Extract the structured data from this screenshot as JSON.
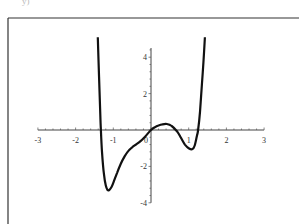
{
  "corner_label": "y)",
  "chart_data": {
    "type": "line",
    "title": "",
    "xlabel": "",
    "ylabel": "",
    "xlim": [
      -3,
      3
    ],
    "ylim": [
      -4,
      5
    ],
    "x_ticks": [
      "-3",
      "-2",
      "-1",
      "0",
      "1",
      "2",
      "3"
    ],
    "y_ticks": [
      "4",
      "2",
      "-2",
      "-4"
    ],
    "grid": false,
    "legend": null,
    "series": [
      {
        "name": "f(x)",
        "color": "#111111",
        "x": [
          -1.41,
          -1.38,
          -1.35,
          -1.33,
          -1.3,
          -1.25,
          -1.2,
          -1.15,
          -1.11,
          -1.05,
          -1.0,
          -0.9,
          -0.8,
          -0.7,
          -0.6,
          -0.5,
          -0.4,
          -0.27,
          -0.15,
          0.0,
          0.1,
          0.2,
          0.3,
          0.42,
          0.55,
          0.7,
          0.8,
          0.9,
          1.0,
          1.1,
          1.16,
          1.22,
          1.25,
          1.3,
          1.35,
          1.39,
          1.43
        ],
        "y": [
          5.1,
          3.0,
          1.2,
          0.0,
          -1.2,
          -2.4,
          -3.05,
          -3.3,
          -3.3,
          -3.15,
          -2.9,
          -2.35,
          -1.85,
          -1.45,
          -1.15,
          -0.95,
          -0.8,
          -0.6,
          -0.35,
          0.0,
          0.15,
          0.25,
          0.31,
          0.33,
          0.22,
          -0.1,
          -0.45,
          -0.8,
          -1.0,
          -1.05,
          -0.85,
          -0.3,
          0.0,
          1.0,
          2.5,
          3.7,
          5.1
        ]
      }
    ]
  }
}
